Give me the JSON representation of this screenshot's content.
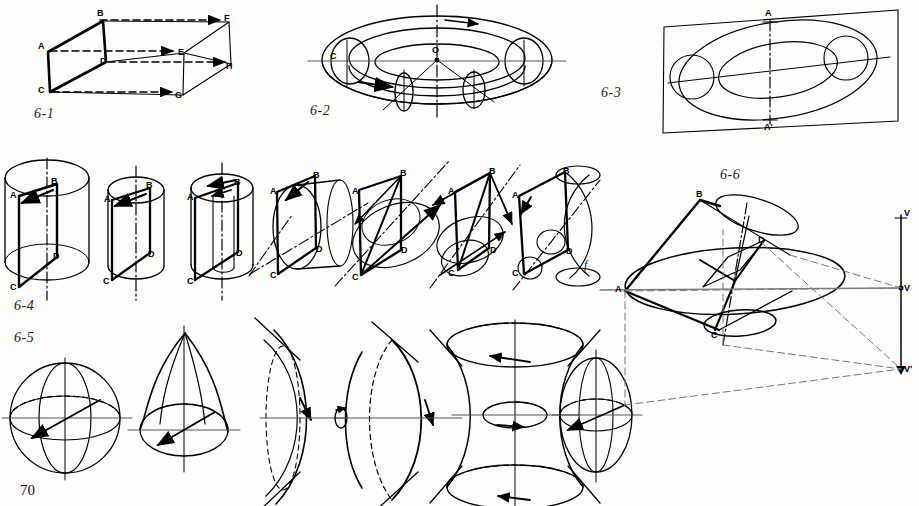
{
  "page": {
    "number": "70",
    "background_color": "#fdfdfc",
    "ink_color": "#000000",
    "width": 919,
    "height": 506
  },
  "figures": [
    {
      "id": "6-1",
      "label": "6-1",
      "caption_pos": {
        "x": 34,
        "y": 113
      },
      "description": "parallelepiped-translation",
      "vertices": [
        {
          "name": "A",
          "x": 42,
          "y": 47
        },
        {
          "name": "B",
          "x": 97,
          "y": 14
        },
        {
          "name": "C",
          "x": 42,
          "y": 88
        },
        {
          "name": "D",
          "x": 99,
          "y": 56
        },
        {
          "name": "E",
          "x": 178,
          "y": 48
        },
        {
          "name": "F",
          "x": 224,
          "y": 17
        },
        {
          "name": "G",
          "x": 176,
          "y": 91
        },
        {
          "name": "H",
          "x": 226,
          "y": 63
        }
      ]
    },
    {
      "id": "6-2",
      "label": "6-2",
      "caption_pos": {
        "x": 310,
        "y": 110
      },
      "description": "torus-generated-by-rotating-circle",
      "vertices": [
        {
          "name": "C",
          "x": 330,
          "y": 56
        },
        {
          "name": "O",
          "x": 434,
          "y": 52
        }
      ]
    },
    {
      "id": "6-3",
      "label": "6-3",
      "caption_pos": {
        "x": 601,
        "y": 92
      },
      "description": "torus-section-in-plane-axis-AA",
      "vertices": [
        {
          "name": "A",
          "x": 716,
          "y": 10
        },
        {
          "name": "A'",
          "x": 718,
          "y": 124
        }
      ]
    },
    {
      "id": "6-4",
      "label": "6-4",
      "caption_pos": {
        "x": 14,
        "y": 305
      },
      "description": "rotating-rectangle-ABCD-generating-cylinder-cone-hyperboloid-series",
      "sub_label": "f",
      "sub_label_pos": {
        "x": 584,
        "y": 264
      },
      "steps": [
        {
          "index": "a",
          "vertices": [
            "A",
            "B",
            "C",
            "D"
          ]
        },
        {
          "index": "b",
          "vertices": [
            "A",
            "B",
            "C",
            "D"
          ]
        },
        {
          "index": "c",
          "vertices": [
            "A",
            "B",
            "C",
            "D"
          ]
        },
        {
          "index": "d",
          "vertices": [
            "A",
            "B",
            "C",
            "D"
          ]
        },
        {
          "index": "e",
          "vertices": [
            "A",
            "B",
            "C",
            "D"
          ]
        },
        {
          "index": "f",
          "vertices": [
            "A",
            "B",
            "C",
            "D"
          ]
        }
      ]
    },
    {
      "id": "6-5",
      "label": "6-5",
      "caption_pos": {
        "x": 14,
        "y": 337
      },
      "description": "surfaces-of-revolution-sphere-paraboloid-hyperboloid-ellipsoid"
    },
    {
      "id": "6-6",
      "label": "6-6",
      "caption_pos": {
        "x": 720,
        "y": 174
      },
      "description": "perspective-of-truncated-cone-with-vanishing-points",
      "vertices": [
        {
          "name": "A",
          "x": 620,
          "y": 290
        },
        {
          "name": "B",
          "x": 700,
          "y": 199
        },
        {
          "name": "C",
          "x": 716,
          "y": 326
        },
        {
          "name": "D",
          "x": 760,
          "y": 240
        }
      ],
      "vanishing_points": [
        {
          "name": "V",
          "x": 901,
          "y": 213
        },
        {
          "name": "V",
          "x": 901,
          "y": 288
        },
        {
          "name": "V'",
          "x": 901,
          "y": 369
        }
      ]
    }
  ]
}
